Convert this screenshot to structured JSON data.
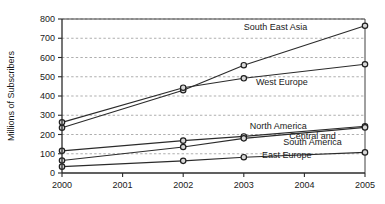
{
  "chart_data": {
    "type": "line",
    "title": "",
    "subtitle": "",
    "xlabel": "",
    "ylabel": "Millions of Subscribers",
    "x": [
      2000,
      2002,
      2003,
      2005
    ],
    "categories": [
      "2000",
      "2002",
      "2003",
      "2005"
    ],
    "x_tick_labels": [
      "2000",
      "2001",
      "2002",
      "2003",
      "2004",
      "2005"
    ],
    "x_ticks": [
      2000,
      2001,
      2002,
      2003,
      2004,
      2005
    ],
    "xlim": [
      2000,
      2005
    ],
    "ylim": [
      0,
      800
    ],
    "y_ticks": [
      0,
      100,
      200,
      300,
      400,
      500,
      600,
      700,
      800
    ],
    "y_tick_labels": [
      "0",
      "100",
      "200",
      "300",
      "400",
      "500",
      "600",
      "700",
      "800"
    ],
    "grid": "horizontal-dashed",
    "legend_position": "inline-right",
    "marker": "circle",
    "series": [
      {
        "name": "South East Asia",
        "values": [
          235,
          430,
          560,
          765
        ]
      },
      {
        "name": "West Europe",
        "values": [
          263,
          443,
          492,
          565
        ]
      },
      {
        "name": "North America",
        "values": [
          115,
          168,
          190,
          243
        ]
      },
      {
        "name": "Central and South America",
        "values": [
          65,
          135,
          180,
          237
        ]
      },
      {
        "name": "East Europe",
        "values": [
          33,
          63,
          82,
          107
        ]
      }
    ],
    "annotations": [
      {
        "text": "South East Asia",
        "x": 2003.0,
        "y": 745
      },
      {
        "text": "West Europe",
        "x": 2003.2,
        "y": 455
      },
      {
        "text": "North America",
        "x": 2003.1,
        "y": 228
      },
      {
        "text": "Central and",
        "x": 2003.75,
        "y": 175
      },
      {
        "text": "South America",
        "x": 2003.65,
        "y": 143
      },
      {
        "text": "East Europe",
        "x": 2003.3,
        "y": 78
      }
    ]
  },
  "colors": {
    "background": "#ffffff",
    "line": "#2b2b2b",
    "grid": "#8c8c8c",
    "axis": "#2b2b2b",
    "marker_fill": "#d8d8d8",
    "marker_stroke": "#1f1f1f",
    "text": "#1a1a1a"
  }
}
